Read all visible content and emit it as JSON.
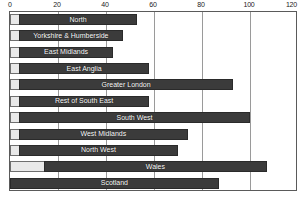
{
  "chart_data": {
    "type": "bar",
    "orientation": "horizontal",
    "title": "",
    "subtitle": "",
    "xlabel": "",
    "ylabel": "",
    "xlim": [
      0,
      120
    ],
    "x_ticks": [
      0,
      20,
      40,
      60,
      80,
      100,
      120
    ],
    "x_tick_labels": [
      "0",
      "20",
      "40",
      "60",
      "80",
      "100",
      "120"
    ],
    "grid": true,
    "grid_axis": "x",
    "legend": false,
    "legend_position": "none",
    "labels_inside_bars": true,
    "categories": [
      "North",
      "Yorkshire & Humberside",
      "East Midlands",
      "East Anglia",
      "Greater London",
      "Rest of South East",
      "South West",
      "West Midlands",
      "North West",
      "Wales",
      "Scotland"
    ],
    "values": [
      53,
      47,
      43,
      58,
      93,
      58,
      100,
      74,
      70,
      107,
      87
    ],
    "bars": [
      {
        "label": "North",
        "value": 53,
        "cap": "small"
      },
      {
        "label": "Yorkshire & Humberside",
        "value": 47,
        "cap": "small"
      },
      {
        "label": "East Midlands",
        "value": 43,
        "cap": "small"
      },
      {
        "label": "East Anglia",
        "value": 58,
        "cap": "small"
      },
      {
        "label": "Greater London",
        "value": 93,
        "cap": "small"
      },
      {
        "label": "Rest of South East",
        "value": 58,
        "cap": "small"
      },
      {
        "label": "South West",
        "value": 100,
        "cap": "small"
      },
      {
        "label": "West Midlands",
        "value": 74,
        "cap": "small"
      },
      {
        "label": "North West",
        "value": 70,
        "cap": "small"
      },
      {
        "label": "Wales",
        "value": 107,
        "cap": "wide"
      },
      {
        "label": "Scotland",
        "value": 87,
        "cap": "none"
      }
    ],
    "colors": {
      "bar_fill": "#3b3b3b",
      "bar_stroke": "#2a2a2a",
      "bar_cap_fill": "#e9e9e9",
      "gridline": "#9a9a9a",
      "axis_frame": "#5a5a5a",
      "bar_label_text": "#ffffff",
      "tick_label_text": "#1a1a1a",
      "background": "#ffffff"
    }
  }
}
